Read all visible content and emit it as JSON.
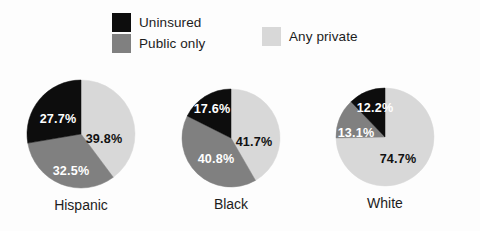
{
  "chart_data": {
    "type": "pie",
    "title": "",
    "subtitle": "",
    "xlabel": "",
    "ylabel": "",
    "legend_position": "top",
    "grid": false,
    "value_suffix": "%",
    "start_angle_deg": 0,
    "direction": "clockwise",
    "series": [
      {
        "name": "Any private",
        "color": "#d8d8d8",
        "values": [
          39.8,
          41.7,
          74.7
        ]
      },
      {
        "name": "Public only",
        "color": "#808080",
        "values": [
          32.5,
          40.8,
          13.1
        ]
      },
      {
        "name": "Uninsured",
        "color": "#0d0d0d",
        "values": [
          27.7,
          17.6,
          12.2
        ]
      }
    ],
    "categories": [
      "Hispanic",
      "Black",
      "White"
    ],
    "charts": [
      {
        "caption": "Hispanic",
        "cx": 81,
        "cy": 134,
        "r": 54,
        "slices": [
          {
            "label": "Any private",
            "value": 39.8,
            "display": "39.8%",
            "color": "#d8d8d8",
            "text_tone": "on-light",
            "label_x": 104,
            "label_y": 140
          },
          {
            "label": "Public only",
            "value": 32.5,
            "display": "32.5%",
            "color": "#808080",
            "text_tone": "on-mid",
            "label_x": 71,
            "label_y": 172
          },
          {
            "label": "Uninsured",
            "value": 27.7,
            "display": "27.7%",
            "color": "#0d0d0d",
            "text_tone": "on-dark",
            "label_x": 58,
            "label_y": 120
          }
        ]
      },
      {
        "caption": "Black",
        "cx": 231,
        "cy": 138,
        "r": 49,
        "slices": [
          {
            "label": "Any private",
            "value": 41.7,
            "display": "41.7%",
            "color": "#d8d8d8",
            "text_tone": "on-light",
            "label_x": 254,
            "label_y": 143
          },
          {
            "label": "Public only",
            "value": 40.8,
            "display": "40.8%",
            "color": "#808080",
            "text_tone": "on-mid",
            "label_x": 216,
            "label_y": 160
          },
          {
            "label": "Uninsured",
            "value": 17.6,
            "display": "17.6%",
            "color": "#0d0d0d",
            "text_tone": "on-dark",
            "label_x": 212,
            "label_y": 110
          }
        ]
      },
      {
        "caption": "White",
        "cx": 385,
        "cy": 137,
        "r": 49,
        "slices": [
          {
            "label": "Any private",
            "value": 74.7,
            "display": "74.7%",
            "color": "#d8d8d8",
            "text_tone": "on-light",
            "label_x": 398,
            "label_y": 160
          },
          {
            "label": "Public only",
            "value": 13.1,
            "display": "13.1%",
            "color": "#808080",
            "text_tone": "on-mid",
            "label_x": 356,
            "label_y": 134
          },
          {
            "label": "Uninsured",
            "value": 12.2,
            "display": "12.2%",
            "color": "#0d0d0d",
            "text_tone": "on-dark",
            "label_x": 375,
            "label_y": 109
          }
        ]
      }
    ]
  },
  "legend": {
    "items": [
      {
        "label": "Uninsured",
        "color": "#0d0d0d"
      },
      {
        "label": "Public only",
        "color": "#808080"
      },
      {
        "label": "Any private",
        "color": "#d8d8d8"
      }
    ]
  },
  "captions": {
    "hispanic": "Hispanic",
    "black": "Black",
    "white": "White"
  }
}
